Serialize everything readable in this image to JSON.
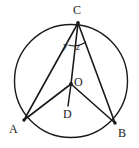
{
  "figure": {
    "kind": "circle-geometry-diagram",
    "background_color": "#ffffff",
    "stroke_color": "#1a1a1a",
    "label_color": "#1a1a1a"
  },
  "circle": {
    "name": "circumscribed-circle",
    "center_label": "O",
    "cx": 71,
    "cy": 81,
    "r": 56.5
  },
  "points": {
    "C": {
      "label": "C",
      "x": 78,
      "y": 23
    },
    "O": {
      "label": "O",
      "x": 71,
      "y": 84
    },
    "D": {
      "label": "D",
      "x": 68,
      "y": 106
    },
    "A": {
      "label": "A",
      "x": 24,
      "y": 120
    },
    "B": {
      "label": "B",
      "x": 115,
      "y": 123
    }
  },
  "segments": [
    {
      "name": "segment-CA",
      "from": "C",
      "to": "A"
    },
    {
      "name": "segment-CO",
      "from": "C",
      "to": "O"
    },
    {
      "name": "segment-CB",
      "from": "C",
      "to": "B"
    },
    {
      "name": "segment-OA",
      "from": "O",
      "to": "A"
    },
    {
      "name": "segment-OB",
      "from": "O",
      "to": "B"
    },
    {
      "name": "segment-OD",
      "from": "O",
      "to": "D"
    }
  ],
  "angles": {
    "y": {
      "label": "y",
      "vertex": "C",
      "between": [
        "CA",
        "CO"
      ]
    },
    "z": {
      "label": "z",
      "vertex": "C",
      "between": [
        "CO",
        "CB"
      ]
    }
  }
}
